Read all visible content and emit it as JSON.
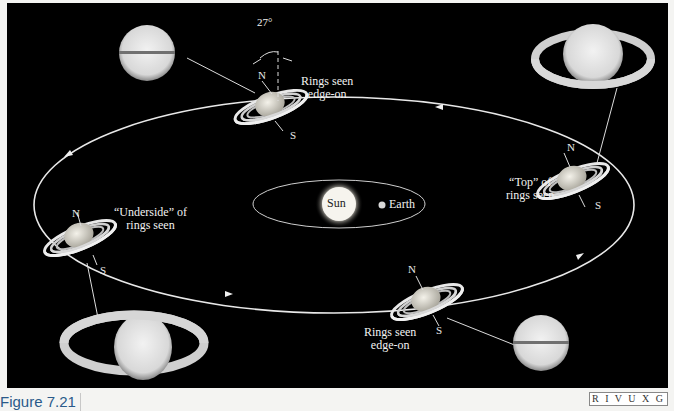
{
  "figure": {
    "caption": "Figure 7.21",
    "wavebands": "R I V U X G",
    "tilt_angle": "27°",
    "center": {
      "sun_label": "Sun",
      "earth_label": "Earth"
    },
    "positions": [
      {
        "id": "top",
        "label_line1": "Rings seen",
        "label_line2": "edge-on",
        "north": "N",
        "south": "S",
        "photo": "Saturn rings edge-on (banded disk)"
      },
      {
        "id": "right",
        "label_line1": "“Top” of",
        "label_line2": "rings seen",
        "north": "N",
        "south": "S",
        "photo": "Saturn rings open, top view"
      },
      {
        "id": "bottom",
        "label_line1": "Rings seen",
        "label_line2": "edge-on",
        "north": "N",
        "south": "S",
        "photo": "Saturn rings edge-on (banded disk)"
      },
      {
        "id": "left",
        "label_line1": "“Underside” of",
        "label_line2": "rings seen",
        "north": "N",
        "south": "S",
        "photo": "Saturn rings open, underside view"
      }
    ],
    "colors": {
      "background": "#000000",
      "orbit": "#e8e8e8",
      "page": "#f4f4f2",
      "caption": "#2a5a8a"
    }
  }
}
